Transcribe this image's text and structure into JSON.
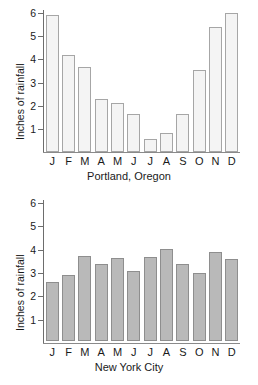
{
  "chart_data": [
    {
      "type": "bar",
      "title": "",
      "caption": "Portland, Oregon",
      "xlabel": "",
      "ylabel": "Inches of rainfall",
      "categories": [
        "J",
        "F",
        "M",
        "A",
        "M",
        "J",
        "J",
        "A",
        "S",
        "O",
        "N",
        "D"
      ],
      "values": [
        5.9,
        4.2,
        3.65,
        2.3,
        2.1,
        1.65,
        0.55,
        0.8,
        1.65,
        3.55,
        5.4,
        6.0
      ],
      "ylim": [
        0,
        6
      ],
      "yticks": [
        1,
        2,
        3,
        4,
        5,
        6
      ],
      "ytick_labels": [
        "1",
        "2",
        "3",
        "4",
        "5",
        "6"
      ],
      "grid": false,
      "legend": "none",
      "bar_fill": "#f4f4f4",
      "bar_edge": "#a6a6a6"
    },
    {
      "type": "bar",
      "title": "",
      "caption": "New York City",
      "xlabel": "",
      "ylabel": "Inches of rainfall",
      "categories": [
        "J",
        "F",
        "M",
        "A",
        "M",
        "J",
        "J",
        "A",
        "S",
        "O",
        "N",
        "D"
      ],
      "values": [
        2.55,
        2.85,
        3.65,
        3.3,
        3.55,
        3.0,
        3.6,
        3.95,
        3.3,
        2.9,
        3.8,
        3.5
      ],
      "ylim": [
        0,
        6
      ],
      "yticks": [
        1,
        2,
        3,
        4,
        5,
        6
      ],
      "ytick_labels": [
        "1",
        "2",
        "3",
        "4",
        "5",
        "6"
      ],
      "grid": false,
      "legend": "none",
      "bar_fill": "#b9b9b9",
      "bar_edge": "#8e8e8e"
    }
  ]
}
